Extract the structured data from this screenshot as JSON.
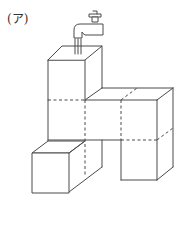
{
  "figure": {
    "label": "(ア)",
    "colors": {
      "line": "#4a4a4a",
      "background": "#ffffff"
    }
  }
}
